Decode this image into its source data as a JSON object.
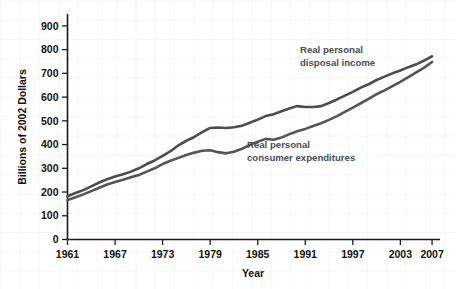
{
  "chart_data": {
    "type": "line",
    "title": "",
    "xlabel": "Year",
    "ylabel": "Billions of 2002 Dollars",
    "grid": "faint graph-paper background grid",
    "legend_position": "inline annotations next to lines",
    "xlim": [
      1961,
      2008
    ],
    "ylim": [
      0,
      950
    ],
    "ytick_values": [
      0,
      100,
      200,
      300,
      400,
      500,
      600,
      700,
      800,
      900
    ],
    "ytick_labels": [
      "0",
      "100",
      "200",
      "300",
      "400",
      "500",
      "600",
      "700",
      "800",
      "900"
    ],
    "xtick_values": [
      1961,
      1967,
      1973,
      1979,
      1985,
      1991,
      1997,
      2003,
      2007
    ],
    "xtick_labels": [
      "1961",
      "1967",
      "1973",
      "1979",
      "1985",
      "1991",
      "1997",
      "2003",
      "2007"
    ],
    "x": [
      1961,
      1962,
      1963,
      1964,
      1965,
      1966,
      1967,
      1968,
      1969,
      1970,
      1971,
      1972,
      1973,
      1974,
      1975,
      1976,
      1977,
      1978,
      1979,
      1980,
      1981,
      1982,
      1983,
      1984,
      1985,
      1986,
      1987,
      1988,
      1989,
      1990,
      1991,
      1992,
      1993,
      1994,
      1995,
      1996,
      1997,
      1998,
      1999,
      2000,
      2001,
      2002,
      2003,
      2004,
      2005,
      2006,
      2007
    ],
    "series": [
      {
        "name": "Real personal disposal income",
        "color": "#4d4d4d",
        "annotation": "Real personal\ndisposal income",
        "annotation_lines": [
          "Real personal",
          "disposal income"
        ],
        "values": [
          182,
          196,
          208,
          224,
          240,
          254,
          265,
          275,
          286,
          300,
          318,
          333,
          352,
          372,
          397,
          416,
          432,
          452,
          470,
          472,
          470,
          473,
          479,
          492,
          505,
          520,
          528,
          540,
          552,
          562,
          558,
          558,
          562,
          575,
          590,
          606,
          622,
          640,
          654,
          672,
          686,
          700,
          712,
          726,
          738,
          754,
          772
        ]
      },
      {
        "name": "Real personal consumer expenditures",
        "color": "#555555",
        "annotation": "Real personal\nconsumer expenditures",
        "annotation_lines": [
          "Real personal",
          "consumer expenditures"
        ],
        "values": [
          166,
          178,
          190,
          204,
          218,
          232,
          242,
          252,
          262,
          272,
          286,
          300,
          318,
          332,
          344,
          356,
          366,
          374,
          376,
          368,
          363,
          370,
          382,
          398,
          412,
          424,
          420,
          430,
          444,
          456,
          466,
          478,
          490,
          504,
          520,
          538,
          556,
          574,
          592,
          612,
          628,
          646,
          664,
          684,
          704,
          724,
          748
        ]
      }
    ],
    "annotations": [
      {
        "text_lines": [
          "Real personal",
          "disposal income"
        ],
        "x_px": 300,
        "y_px": 53
      },
      {
        "text_lines": [
          "Real personal",
          "consumer expenditures"
        ],
        "x_px": 247,
        "y_px": 148
      }
    ]
  }
}
